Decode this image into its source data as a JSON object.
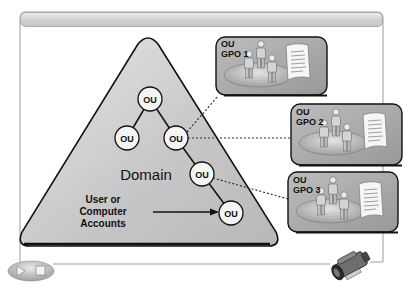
{
  "diagram": {
    "domain_label": "Domain",
    "accounts_label": [
      "User or",
      "Computer",
      "Accounts"
    ],
    "ou_nodes": [
      {
        "id": "root",
        "label": "OU",
        "cx": 150,
        "cy": 99
      },
      {
        "id": "left",
        "label": "OU",
        "cx": 127,
        "cy": 138
      },
      {
        "id": "right",
        "label": "OU",
        "cx": 176,
        "cy": 138
      },
      {
        "id": "lower",
        "label": "OU",
        "cx": 202,
        "cy": 174
      },
      {
        "id": "bottom",
        "label": "OU",
        "cx": 231,
        "cy": 213
      }
    ],
    "gpo_boxes": [
      {
        "line1": "OU",
        "line2": "GPO 1"
      },
      {
        "line1": "OU",
        "line2": "GPO 2"
      },
      {
        "line1": "OU",
        "line2": "GPO 3"
      }
    ]
  },
  "controls": {
    "play_icon": "play-icon",
    "stop_icon": "stop-icon",
    "camera_icon": "video-camera-icon"
  },
  "colors": {
    "triangle_fill": "#c4c4c4",
    "gpo_fill": "#a8a8a8",
    "header_band": "#d8d8d8",
    "outline": "#1a1a1a"
  }
}
